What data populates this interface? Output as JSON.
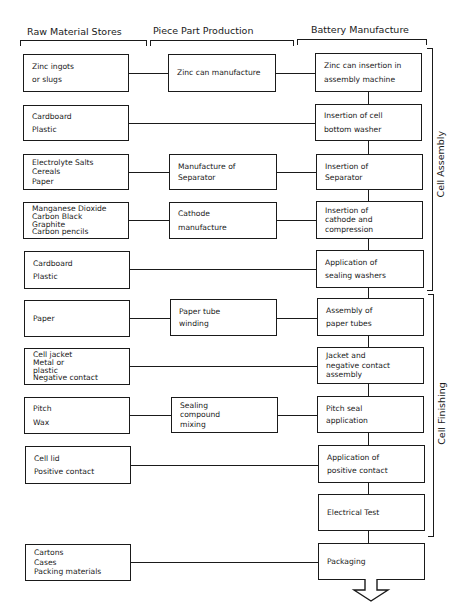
{
  "headers": {
    "raw_material": "Raw Material Stores",
    "piece_part": "Piece Part Production",
    "battery": "Battery Manufacture"
  },
  "groups": {
    "cell_assembly": "Cell   Assembly",
    "cell_finishing": "Cell   Finishing"
  },
  "rows": [
    {
      "raw": [
        "Zinc ingots",
        "or slugs"
      ],
      "part": [
        "Zinc can manufacture"
      ],
      "battery": [
        "Zinc can insertion in",
        "assembly machine"
      ]
    },
    {
      "raw": [
        "Cardboard",
        "Plastic"
      ],
      "part": null,
      "battery": [
        "Insertion of cell",
        "bottom washer"
      ]
    },
    {
      "raw": [
        "Electrolyte Salts",
        "Cereals",
        "Paper"
      ],
      "part": [
        "Manufacture of",
        "Separator"
      ],
      "battery": [
        "Insertion of",
        "Separator"
      ]
    },
    {
      "raw": [
        "Manganese Dioxide",
        "Carbon Black",
        "Graphite",
        "Carbon pencils"
      ],
      "part": [
        "Cathode",
        "manufacture"
      ],
      "battery": [
        "Insertion of",
        "cathode and",
        "compression"
      ]
    },
    {
      "raw": [
        "Cardboard",
        "Plastic"
      ],
      "part": null,
      "battery": [
        "Application of",
        "sealing washers"
      ]
    },
    {
      "raw": [
        "Paper"
      ],
      "part": [
        "Paper tube",
        "winding"
      ],
      "battery": [
        "Assembly of",
        "paper tubes"
      ]
    },
    {
      "raw": [
        "Cell jacket",
        "Metal or",
        "plastic",
        "Negative contact"
      ],
      "part": null,
      "battery": [
        "Jacket and",
        "negative contact",
        "assembly"
      ]
    },
    {
      "raw": [
        "Pitch",
        "Wax"
      ],
      "part": [
        "Sealing",
        "compound",
        "mixing"
      ],
      "battery": [
        "Pitch seal",
        "application"
      ]
    },
    {
      "raw": [
        "Cell lid",
        "Positive contact"
      ],
      "part": null,
      "battery": [
        "Application of",
        "positive contact"
      ]
    },
    {
      "raw": null,
      "part": null,
      "battery": [
        "Electrical Test"
      ]
    },
    {
      "raw": [
        "Cartons",
        "Cases",
        "Packing materials"
      ],
      "part": null,
      "battery": [
        "Packaging"
      ]
    }
  ],
  "colors": {
    "line": "#1a1a1a",
    "background": "#ffffff"
  }
}
